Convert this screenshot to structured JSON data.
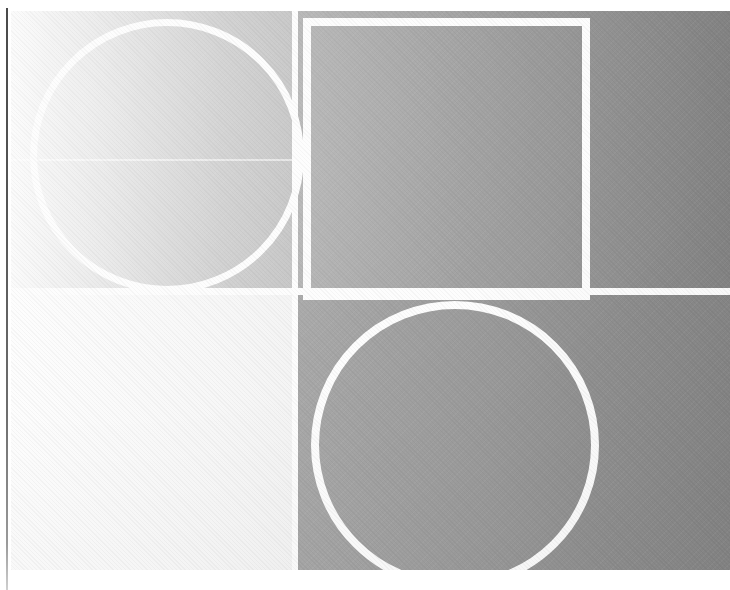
{
  "document": {
    "kind": "abstract-grayscale-composition",
    "width": 730,
    "height": 590,
    "background": "#ffffff",
    "caption": ""
  },
  "plate": {
    "left": 11,
    "top": 11,
    "width": 719,
    "height": 559,
    "wash_direction": "left-to-right light-to-dark",
    "wash_start_color": "#f6f6f6",
    "wash_end_color": "#838383"
  },
  "margin_rule": {
    "name": "left-margin-rule",
    "color": "#4a4a4a",
    "x": 6,
    "top": 8,
    "thickness": 2
  },
  "quadrants": [
    {
      "id": "top-left",
      "label": "",
      "tone": "light",
      "start_color": "#fbfbfb",
      "end_color": "#c4c4c4",
      "x": 0,
      "y": 0,
      "width": 285,
      "height": 281
    },
    {
      "id": "top-right",
      "label": "",
      "tone": "mid-dark",
      "start_color": "#b4b4b4",
      "end_color": "#848484",
      "x": 285,
      "y": 0,
      "width": 434,
      "height": 281
    },
    {
      "id": "bottom-left",
      "label": "",
      "tone": "near-white",
      "start_color": "#fdfdfd",
      "end_color": "#f4f4f4",
      "x": 0,
      "y": 281,
      "width": 285,
      "height": 278
    },
    {
      "id": "bottom-right",
      "label": "",
      "tone": "mid",
      "start_color": "#a8a8a8",
      "end_color": "#868686",
      "x": 285,
      "y": 281,
      "width": 434,
      "height": 278
    }
  ],
  "shapes": [
    {
      "id": "circle-top-left",
      "type": "circle-outline",
      "stroke_color": "#fdfdfd",
      "stroke_width": 7,
      "cx": 160,
      "cy": 149,
      "diameter": 267
    },
    {
      "id": "rectangle-top-right",
      "type": "rectangle-outline",
      "stroke_color": "#fdfdfd",
      "stroke_width": 8,
      "x": 292,
      "y": 7,
      "width": 287,
      "height": 282
    },
    {
      "id": "circle-bottom-right",
      "type": "circle-outline",
      "stroke_color": "#fdfdfd",
      "stroke_width": 8,
      "cx": 447,
      "cy": 437,
      "diameter": 288
    }
  ],
  "gutters": {
    "vertical_x": 281,
    "vertical_width": 6,
    "horizontal_y": 277,
    "horizontal_height": 7,
    "color": "#fdfdfd"
  },
  "artifacts": {
    "seam_y": 148,
    "grain_opacity": 0.055
  }
}
